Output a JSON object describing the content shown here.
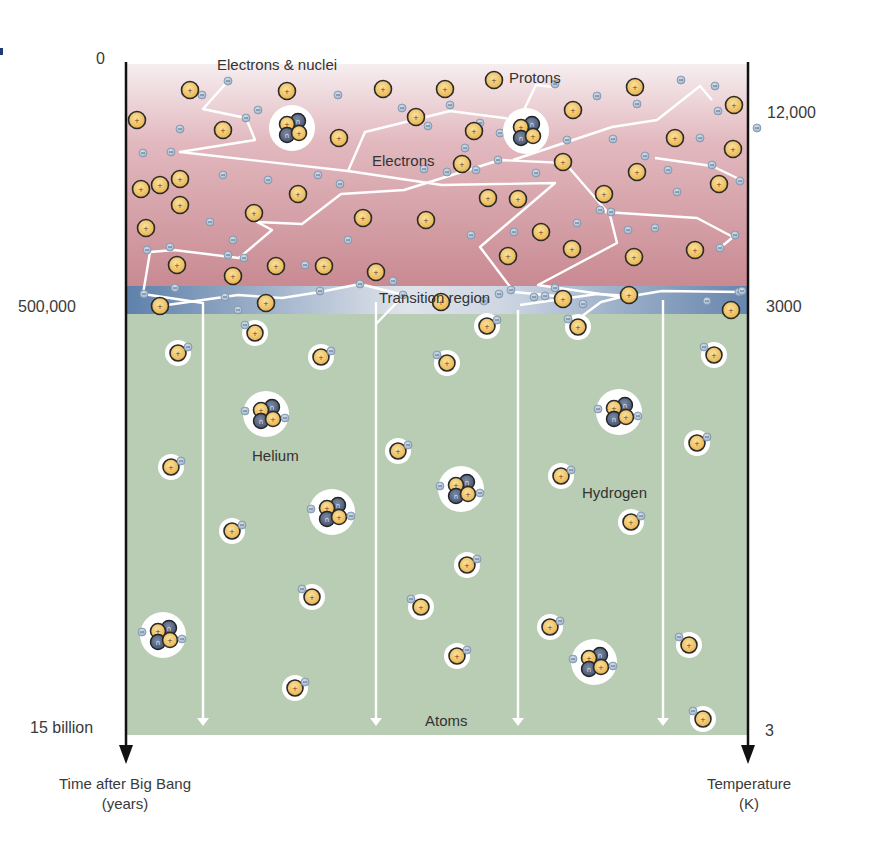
{
  "figure": {
    "left_axis": {
      "title_line1": "Time after Big Bang",
      "title_line2": "(years)",
      "ticks": [
        {
          "label": "0",
          "y": 59
        },
        {
          "label": "500,000",
          "y": 308
        },
        {
          "label": "15 billion",
          "y": 728
        }
      ]
    },
    "right_axis": {
      "title_line1": "Temperature",
      "title_line2": "(K)",
      "ticks": [
        {
          "label": "12,000",
          "y": 115
        },
        {
          "label": "3000",
          "y": 308
        },
        {
          "label": "3",
          "y": 732
        }
      ]
    },
    "labels": {
      "electrons_nuclei": "Electrons & nuclei",
      "protons": "Protons",
      "electrons": "Electrons",
      "transition": "Transition region",
      "helium": "Helium",
      "hydrogen": "Hydrogen",
      "atoms": "Atoms"
    },
    "colors": {
      "plasma_top": "#f3e6e8",
      "plasma_bottom": "#c9888f",
      "transition_dark": "#5f7fa8",
      "transition_light": "#d8dde6",
      "atoms_bg": "#b8cdb3",
      "proton_fill": "#f0c865",
      "neutron_fill": "#5a6a86",
      "electron_fill": "#b7c6d6",
      "photon": "#ffffff",
      "axis": "#111111"
    },
    "plasma": {
      "protons": [
        [
          190,
          90
        ],
        [
          287,
          91
        ],
        [
          383,
          89
        ],
        [
          445,
          89
        ],
        [
          494,
          80
        ],
        [
          635,
          87
        ],
        [
          734,
          105
        ],
        [
          137,
          120
        ],
        [
          223,
          130
        ],
        [
          339,
          138
        ],
        [
          416,
          117
        ],
        [
          474,
          131
        ],
        [
          573,
          110
        ],
        [
          675,
          138
        ],
        [
          160,
          185
        ],
        [
          180,
          179
        ],
        [
          298,
          194
        ],
        [
          462,
          164
        ],
        [
          563,
          162
        ],
        [
          637,
          172
        ],
        [
          719,
          184
        ],
        [
          141,
          189
        ],
        [
          180,
          205
        ],
        [
          254,
          213
        ],
        [
          363,
          218
        ],
        [
          426,
          220
        ],
        [
          488,
          198
        ],
        [
          518,
          199
        ],
        [
          604,
          194
        ],
        [
          733,
          149
        ],
        [
          146,
          228
        ],
        [
          541,
          232
        ],
        [
          634,
          257
        ],
        [
          695,
          250
        ],
        [
          177,
          265
        ],
        [
          233,
          276
        ],
        [
          276,
          266
        ],
        [
          324,
          266
        ],
        [
          376,
          272
        ],
        [
          508,
          256
        ],
        [
          572,
          249
        ],
        [
          160,
          306
        ],
        [
          266,
          303
        ],
        [
          441,
          302
        ],
        [
          563,
          299
        ],
        [
          629,
          295
        ],
        [
          731,
          310
        ]
      ],
      "electrons": [
        [
          228,
          81
        ],
        [
          202,
          95
        ],
        [
          258,
          110
        ],
        [
          246,
          118
        ],
        [
          180,
          129
        ],
        [
          305,
          129
        ],
        [
          338,
          95
        ],
        [
          402,
          108
        ],
        [
          428,
          126
        ],
        [
          511,
          120
        ],
        [
          555,
          84
        ],
        [
          597,
          96
        ],
        [
          681,
          80
        ],
        [
          715,
          86
        ],
        [
          637,
          104
        ],
        [
          718,
          111
        ],
        [
          700,
          138
        ],
        [
          450,
          105
        ],
        [
          480,
          123
        ],
        [
          500,
          133
        ],
        [
          465,
          148
        ],
        [
          476,
          170
        ],
        [
          498,
          160
        ],
        [
          536,
          173
        ],
        [
          567,
          140
        ],
        [
          613,
          139
        ],
        [
          645,
          156
        ],
        [
          668,
          170
        ],
        [
          712,
          165
        ],
        [
          757,
          128
        ],
        [
          143,
          153
        ],
        [
          171,
          152
        ],
        [
          223,
          175
        ],
        [
          268,
          180
        ],
        [
          318,
          175
        ],
        [
          340,
          184
        ],
        [
          424,
          169
        ],
        [
          447,
          172
        ],
        [
          600,
          210
        ],
        [
          655,
          228
        ],
        [
          677,
          192
        ],
        [
          740,
          181
        ],
        [
          210,
          222
        ],
        [
          233,
          240
        ],
        [
          228,
          255
        ],
        [
          170,
          247
        ],
        [
          147,
          250
        ],
        [
          244,
          258
        ],
        [
          305,
          265
        ],
        [
          348,
          240
        ],
        [
          360,
          284
        ],
        [
          403,
          295
        ],
        [
          484,
          301
        ],
        [
          511,
          290
        ],
        [
          545,
          296
        ],
        [
          555,
          288
        ],
        [
          720,
          248
        ],
        [
          735,
          235
        ],
        [
          628,
          230
        ],
        [
          611,
          212
        ],
        [
          577,
          223
        ],
        [
          707,
          301
        ],
        [
          739,
          292
        ],
        [
          144,
          294
        ],
        [
          175,
          288
        ],
        [
          225,
          297
        ],
        [
          238,
          310
        ],
        [
          320,
          291
        ],
        [
          393,
          281
        ],
        [
          534,
          297
        ],
        [
          583,
          304
        ],
        [
          514,
          232
        ],
        [
          471,
          235
        ],
        [
          499,
          294
        ],
        [
          742,
          291
        ]
      ],
      "helium_nuclei": [
        [
          292,
          128
        ],
        [
          526,
          131
        ]
      ]
    },
    "photon_paths": [
      [
        [
          228,
          81
        ],
        [
          203,
          109
        ],
        [
          246,
          118
        ],
        [
          255,
          140
        ],
        [
          180,
          152
        ],
        [
          348,
          171
        ],
        [
          365,
          132
        ],
        [
          450,
          111
        ],
        [
          519,
          120
        ],
        [
          536,
          85
        ],
        [
          554,
          87
        ]
      ],
      [
        [
          348,
          171
        ],
        [
          442,
          185
        ],
        [
          555,
          183
        ],
        [
          480,
          247
        ],
        [
          514,
          292
        ],
        [
          556,
          296
        ]
      ],
      [
        [
          143,
          294
        ],
        [
          150,
          252
        ],
        [
          174,
          250
        ],
        [
          239,
          258
        ],
        [
          272,
          230
        ],
        [
          257,
          222
        ],
        [
          302,
          224
        ],
        [
          341,
          194
        ],
        [
          404,
          190
        ],
        [
          500,
          160
        ],
        [
          565,
          163
        ],
        [
          610,
          215
        ],
        [
          617,
          243
        ],
        [
          538,
          285
        ],
        [
          621,
          297
        ],
        [
          601,
          302
        ],
        [
          570,
          325
        ]
      ],
      [
        [
          203,
          303
        ],
        [
          163,
          297
        ],
        [
          143,
          294
        ]
      ],
      [
        [
          160,
          306
        ],
        [
          238,
          295
        ],
        [
          282,
          298
        ],
        [
          320,
          292
        ],
        [
          360,
          284
        ],
        [
          404,
          295
        ],
        [
          376,
          324
        ]
      ],
      [
        [
          520,
          305
        ],
        [
          597,
          294
        ],
        [
          632,
          296
        ],
        [
          662,
          291
        ],
        [
          742,
          292
        ]
      ],
      [
        [
          605,
          212
        ],
        [
          697,
          218
        ],
        [
          733,
          237
        ],
        [
          720,
          248
        ]
      ],
      [
        [
          655,
          158
        ],
        [
          712,
          166
        ],
        [
          741,
          180
        ]
      ],
      [
        [
          513,
          160
        ],
        [
          612,
          127
        ],
        [
          657,
          120
        ],
        [
          700,
          86
        ],
        [
          712,
          100
        ]
      ]
    ],
    "vertical_photons": [
      {
        "x": 203,
        "y1": 302,
        "y2": 726
      },
      {
        "x": 376,
        "y1": 302,
        "y2": 726
      },
      {
        "x": 518,
        "y1": 310,
        "y2": 726
      },
      {
        "x": 663,
        "y1": 300,
        "y2": 726
      }
    ],
    "atoms": {
      "hydrogen": [
        [
          255,
          333,
          -1
        ],
        [
          178,
          353,
          1
        ],
        [
          321,
          357,
          1
        ],
        [
          487,
          326,
          1
        ],
        [
          578,
          327,
          -1
        ],
        [
          447,
          363,
          -1
        ],
        [
          714,
          355,
          -1
        ],
        [
          697,
          443,
          1
        ],
        [
          171,
          467,
          1
        ],
        [
          398,
          451,
          1
        ],
        [
          561,
          476,
          1
        ],
        [
          232,
          531,
          1
        ],
        [
          631,
          522,
          1
        ],
        [
          467,
          565,
          1
        ],
        [
          312,
          597,
          -1
        ],
        [
          421,
          607,
          -1
        ],
        [
          550,
          627,
          1
        ],
        [
          689,
          645,
          -1
        ],
        [
          457,
          656,
          1
        ],
        [
          295,
          688,
          1
        ],
        [
          703,
          719,
          -1
        ]
      ],
      "helium": [
        [
          266,
          414
        ],
        [
          619,
          412
        ],
        [
          332,
          512
        ],
        [
          461,
          489
        ],
        [
          163,
          635
        ],
        [
          594,
          662
        ]
      ]
    }
  }
}
